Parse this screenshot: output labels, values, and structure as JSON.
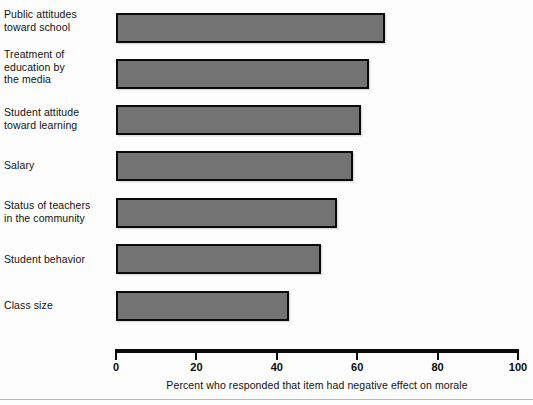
{
  "chart_data": {
    "type": "bar",
    "orientation": "horizontal",
    "title": "",
    "subtitle": "",
    "xlabel": "Percent who responded that item had negative effect on morale",
    "ylabel": "",
    "xlim": [
      0,
      100
    ],
    "xticks": [
      0,
      20,
      40,
      60,
      80,
      100
    ],
    "xtick_labels": [
      "0",
      "20",
      "40",
      "60",
      "80",
      "100"
    ],
    "grid": false,
    "legend": null,
    "categories": [
      "Public attitudes\ntoward school",
      "Treatment of\neducation by\nthe media",
      "Student attitude\ntoward learning",
      "Salary",
      "Status of teachers\nin the community",
      "Student behavior",
      "Class size"
    ],
    "values": [
      67,
      63,
      61,
      59,
      55,
      51,
      43
    ],
    "series": [
      {
        "name": "Percent responding negative effect on morale",
        "values": [
          67,
          63,
          61,
          59,
          55,
          51,
          43
        ]
      }
    ],
    "bar_fill_color": "#737373",
    "bar_edge_color": "#0a0a0a",
    "axis_color": "#0a0a0a",
    "background_color": "#fdfdfd"
  },
  "bars": [
    {
      "label": "Public attitudes\ntoward school",
      "value": 67,
      "top": 13,
      "height": 30,
      "label_top": 8
    },
    {
      "label": "Treatment of\neducation by\nthe media",
      "value": 63,
      "top": 59,
      "height": 30,
      "label_top": 48
    },
    {
      "label": "Student attitude\ntoward learning",
      "value": 61,
      "top": 105,
      "height": 30,
      "label_top": 106
    },
    {
      "label": "Salary",
      "value": 59,
      "top": 151,
      "height": 30,
      "label_top": 159
    },
    {
      "label": "Status of teachers\nin the community",
      "value": 55,
      "top": 198,
      "height": 30,
      "label_top": 199
    },
    {
      "label": "Student behavior",
      "value": 51,
      "top": 244,
      "height": 30,
      "label_top": 253
    },
    {
      "label": "Class size",
      "value": 43,
      "top": 291,
      "height": 30,
      "label_top": 299
    }
  ],
  "axis": {
    "ticks": [
      {
        "label": "0",
        "value": 0
      },
      {
        "label": "20",
        "value": 20
      },
      {
        "label": "40",
        "value": 40
      },
      {
        "label": "60",
        "value": 60
      },
      {
        "label": "80",
        "value": 80
      },
      {
        "label": "100",
        "value": 100
      }
    ],
    "title": "Percent who responded that item had negative effect on morale"
  }
}
